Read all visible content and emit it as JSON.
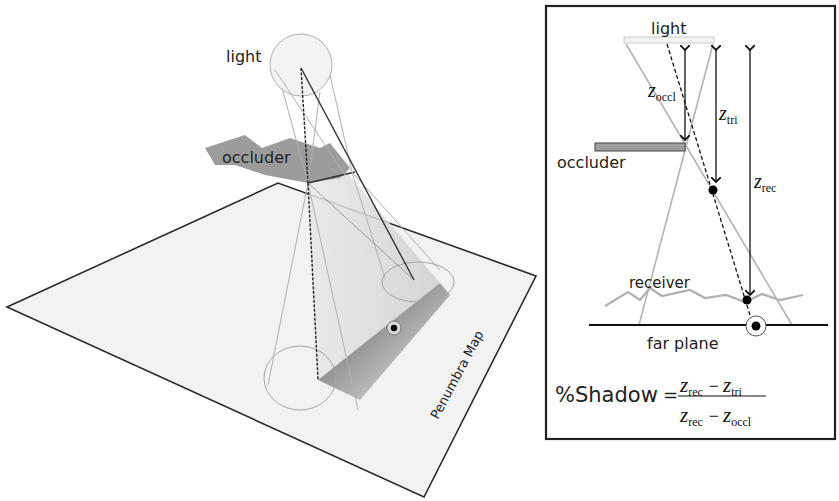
{
  "left_diagram": {
    "labels": {
      "light": "light",
      "occluder": "occluder",
      "plane": "Penumbra Map"
    },
    "colors": {
      "plane_fill": "#f1f1f1",
      "plane_edge": "#2a2a2a",
      "occluder_fill": "#9a9a9a",
      "light_fill": "#f2f2f2",
      "cone_line": "#a8a8a8",
      "dashed_line": "#222222"
    }
  },
  "right_panel": {
    "labels": {
      "light": "light",
      "occluder": "occluder",
      "receiver": "receiver",
      "far_plane": "far plane",
      "z_occl": {
        "base": "z",
        "sub": "occl"
      },
      "z_tri": {
        "base": "z",
        "sub": "tri"
      },
      "z_rec": {
        "base": "z",
        "sub": "rec"
      }
    },
    "formula": {
      "lhs": "%Shadow",
      "equals": "=",
      "numerator": [
        {
          "base": "z",
          "sub": "rec"
        },
        {
          "op": "−"
        },
        {
          "base": "z",
          "sub": "tri"
        }
      ],
      "denominator": [
        {
          "base": "z",
          "sub": "rec"
        },
        {
          "op": "−"
        },
        {
          "base": "z",
          "sub": "occl"
        }
      ]
    },
    "colors": {
      "frame": "#222222",
      "occluder_fill": "#a0a0a0",
      "receiver_line": "#b0b0b0",
      "cone_line": "#b5b5b5"
    }
  }
}
